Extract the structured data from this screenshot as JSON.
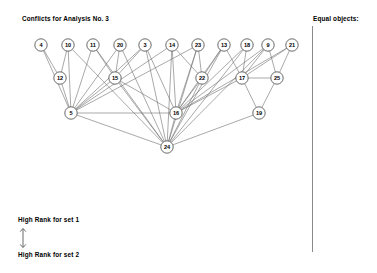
{
  "window": {
    "title": "Conflicts for Analysis No. 3",
    "background": "#ffffff",
    "width": 377,
    "height": 273
  },
  "header": {
    "title": "Conflicts for Analysis No. 3"
  },
  "right_panel": {
    "label": "Equal objects:",
    "divider_color": "#8a8a8a",
    "items": []
  },
  "legend": {
    "top_label": "High Rank for set 1",
    "bottom_label": "High Rank for set 2",
    "arrow": "double-headed-vertical-arrow"
  },
  "chart_data": {
    "type": "diagram",
    "subtype": "directed-acyclic-conflict-graph",
    "title": "Conflicts for Analysis No. 3",
    "node_radius": 6.2,
    "node_fill": "#ffffff",
    "node_stroke": "#3a3a3a",
    "edge_stroke": "#6e6e6e",
    "levels": [
      {
        "y": 45,
        "nodes": [
          "4",
          "10",
          "11",
          "20",
          "3",
          "14",
          "23",
          "13",
          "18",
          "9",
          "21"
        ]
      },
      {
        "y": 78,
        "nodes": [
          "12",
          "15",
          "22",
          "17",
          "25"
        ]
      },
      {
        "y": 113,
        "nodes": [
          "5",
          "16",
          "19"
        ]
      },
      {
        "y": 147,
        "nodes": [
          "24"
        ]
      }
    ],
    "nodes": [
      {
        "id": "4",
        "x": 41,
        "y": 45
      },
      {
        "id": "10",
        "x": 68,
        "y": 45
      },
      {
        "id": "11",
        "x": 93,
        "y": 45
      },
      {
        "id": "20",
        "x": 120,
        "y": 45
      },
      {
        "id": "3",
        "x": 145,
        "y": 45
      },
      {
        "id": "14",
        "x": 172,
        "y": 45
      },
      {
        "id": "23",
        "x": 198,
        "y": 45
      },
      {
        "id": "13",
        "x": 224,
        "y": 45
      },
      {
        "id": "18",
        "x": 247,
        "y": 45
      },
      {
        "id": "9",
        "x": 268,
        "y": 45
      },
      {
        "id": "21",
        "x": 292,
        "y": 45
      },
      {
        "id": "12",
        "x": 60,
        "y": 78
      },
      {
        "id": "15",
        "x": 115,
        "y": 78
      },
      {
        "id": "22",
        "x": 202,
        "y": 78
      },
      {
        "id": "17",
        "x": 242,
        "y": 78
      },
      {
        "id": "25",
        "x": 277,
        "y": 78
      },
      {
        "id": "5",
        "x": 71,
        "y": 113
      },
      {
        "id": "16",
        "x": 176,
        "y": 113
      },
      {
        "id": "19",
        "x": 259,
        "y": 113
      },
      {
        "id": "24",
        "x": 167,
        "y": 147
      }
    ],
    "edges": [
      [
        "4",
        "12"
      ],
      [
        "4",
        "5"
      ],
      [
        "10",
        "12"
      ],
      [
        "10",
        "5"
      ],
      [
        "10",
        "24"
      ],
      [
        "11",
        "5"
      ],
      [
        "11",
        "15"
      ],
      [
        "11",
        "24"
      ],
      [
        "20",
        "15"
      ],
      [
        "20",
        "5"
      ],
      [
        "20",
        "24"
      ],
      [
        "3",
        "5"
      ],
      [
        "3",
        "15"
      ],
      [
        "3",
        "16"
      ],
      [
        "3",
        "24"
      ],
      [
        "14",
        "5"
      ],
      [
        "14",
        "16"
      ],
      [
        "14",
        "24"
      ],
      [
        "14",
        "22"
      ],
      [
        "23",
        "16"
      ],
      [
        "23",
        "24"
      ],
      [
        "23",
        "5"
      ],
      [
        "23",
        "22"
      ],
      [
        "13",
        "16"
      ],
      [
        "13",
        "24"
      ],
      [
        "13",
        "22"
      ],
      [
        "13",
        "17"
      ],
      [
        "18",
        "16"
      ],
      [
        "18",
        "24"
      ],
      [
        "18",
        "17"
      ],
      [
        "9",
        "16"
      ],
      [
        "9",
        "24"
      ],
      [
        "9",
        "17"
      ],
      [
        "9",
        "25"
      ],
      [
        "21",
        "25"
      ],
      [
        "21",
        "17"
      ],
      [
        "21",
        "16"
      ],
      [
        "12",
        "5"
      ],
      [
        "15",
        "5"
      ],
      [
        "15",
        "16"
      ],
      [
        "15",
        "24"
      ],
      [
        "22",
        "16"
      ],
      [
        "22",
        "24"
      ],
      [
        "17",
        "19"
      ],
      [
        "17",
        "25"
      ],
      [
        "17",
        "16"
      ],
      [
        "25",
        "19"
      ],
      [
        "5",
        "24"
      ],
      [
        "5",
        "16"
      ],
      [
        "16",
        "24"
      ],
      [
        "19",
        "24"
      ]
    ]
  }
}
